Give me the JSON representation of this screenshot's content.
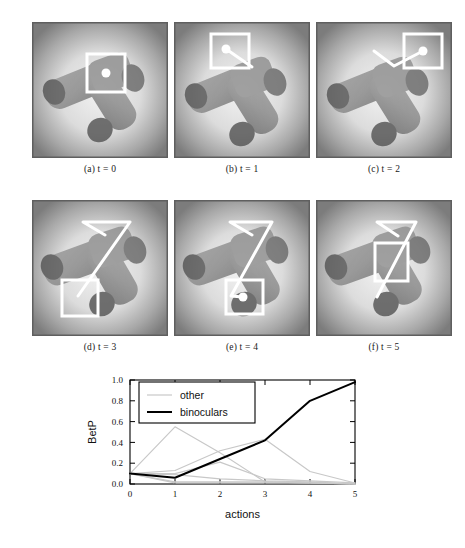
{
  "figure": {
    "panels": [
      {
        "id": "panel-a",
        "caption_label": "(a)",
        "caption_var": "t",
        "caption_value": "0",
        "caption_full": "(a) t = 0",
        "overlay": {
          "box": {
            "x": 55,
            "y": 32,
            "w": 38,
            "h": 38
          },
          "dot": {
            "x": 74,
            "y": 51,
            "r": 4.5
          },
          "trail": []
        }
      },
      {
        "id": "panel-b",
        "caption_label": "(b)",
        "caption_var": "t",
        "caption_value": "1",
        "caption_full": "(b) t = 1",
        "overlay": {
          "box": {
            "x": 37,
            "y": 12,
            "w": 38,
            "h": 34
          },
          "dot": {
            "x": 52,
            "y": 27,
            "r": 4.5
          },
          "trail": [
            [
              52,
              27
            ],
            [
              78,
              45
            ]
          ]
        }
      },
      {
        "id": "panel-c",
        "caption_label": "(c)",
        "caption_var": "t",
        "caption_value": "2",
        "caption_full": "(c) t = 2",
        "overlay": {
          "box": {
            "x": 88,
            "y": 12,
            "w": 38,
            "h": 34
          },
          "dot": {
            "x": 107,
            "y": 29,
            "r": 4.5
          },
          "trail": [
            [
              107,
              29
            ],
            [
              78,
              44
            ],
            [
              58,
              29
            ]
          ]
        }
      },
      {
        "id": "panel-d",
        "caption_label": "(d)",
        "caption_var": "t",
        "caption_value": "3",
        "caption_full": "(d) t = 3",
        "overlay": {
          "box": {
            "x": 30,
            "y": 80,
            "w": 36,
            "h": 36
          },
          "dot": null,
          "trail": [
            [
              46,
              96
            ],
            [
              98,
              22
            ],
            [
              51,
              22
            ],
            [
              73,
              35
            ]
          ]
        }
      },
      {
        "id": "panel-e",
        "caption_label": "(e)",
        "caption_var": "t",
        "caption_value": "4",
        "caption_full": "(e) t = 4",
        "overlay": {
          "box": {
            "x": 52,
            "y": 80,
            "w": 37,
            "h": 34
          },
          "dot": {
            "x": 69,
            "y": 97,
            "r": 4.5
          },
          "trail": [
            [
              69,
              97
            ],
            [
              57,
              96
            ],
            [
              98,
              22
            ],
            [
              56,
              22
            ],
            [
              78,
              35
            ]
          ]
        }
      },
      {
        "id": "panel-f",
        "caption_label": "(f)",
        "caption_var": "t",
        "caption_value": "5",
        "caption_full": "(f) t = 5",
        "overlay": {
          "box": {
            "x": 59,
            "y": 43,
            "w": 33,
            "h": 38
          },
          "dot": null,
          "trail": [
            [
              61,
              97
            ],
            [
              100,
              22
            ],
            [
              61,
              22
            ],
            [
              82,
              36
            ]
          ]
        }
      }
    ]
  },
  "chart_data": {
    "type": "line",
    "title": "",
    "xlabel": "actions",
    "ylabel": "BetP",
    "xlim": [
      0,
      5
    ],
    "ylim": [
      0.0,
      1.0
    ],
    "grid": false,
    "legend_position": "top-left",
    "x": [
      0,
      1,
      2,
      3,
      4,
      5
    ],
    "xticks": [
      "0",
      "1",
      "2",
      "3",
      "4",
      "5"
    ],
    "yticks": [
      "0.0",
      "0.2",
      "0.4",
      "0.6",
      "0.8",
      "1.0"
    ],
    "legend": [
      {
        "name": "other",
        "color": "#c8c8c8",
        "width": 1.2
      },
      {
        "name": "binoculars",
        "color": "#000000",
        "width": 2.0
      }
    ],
    "series": [
      {
        "name": "binoculars",
        "color": "#000000",
        "width": 2.0,
        "values": [
          0.1,
          0.06,
          0.24,
          0.42,
          0.8,
          0.98
        ]
      },
      {
        "name": "other",
        "color": "#c8c8c8",
        "width": 1.2,
        "values": [
          0.1,
          0.55,
          0.3,
          0.02,
          0.01,
          0.0
        ]
      },
      {
        "name": "other",
        "color": "#c8c8c8",
        "width": 1.2,
        "values": [
          0.1,
          0.13,
          0.32,
          0.43,
          0.12,
          0.01
        ]
      },
      {
        "name": "other",
        "color": "#c8c8c8",
        "width": 1.2,
        "values": [
          0.1,
          0.1,
          0.21,
          0.05,
          0.03,
          0.01
        ]
      },
      {
        "name": "other",
        "color": "#c8c8c8",
        "width": 1.2,
        "values": [
          0.1,
          0.09,
          0.05,
          0.03,
          0.02,
          0.0
        ]
      },
      {
        "name": "other",
        "color": "#c8c8c8",
        "width": 1.2,
        "values": [
          0.1,
          0.02,
          0.02,
          0.02,
          0.01,
          0.0
        ]
      },
      {
        "name": "other",
        "color": "#c8c8c8",
        "width": 1.2,
        "values": [
          0.1,
          0.01,
          0.01,
          0.01,
          0.01,
          0.0
        ]
      }
    ]
  }
}
